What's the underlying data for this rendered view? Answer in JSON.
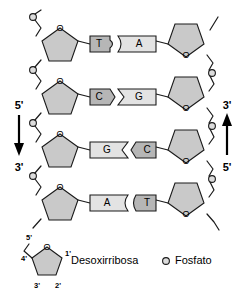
{
  "diagram": {
    "glyphs": {
      "oxygen": "O"
    },
    "strands": {
      "left": {
        "name": "left-strand",
        "top_label": "5'",
        "bottom_label": "3'",
        "direction": "down"
      },
      "right": {
        "name": "right-strand",
        "top_label": "3'",
        "bottom_label": "5'",
        "direction": "up"
      }
    },
    "base_pairs": [
      {
        "left_base": "T",
        "left_type": "pyrimidine",
        "right_base": "A",
        "right_type": "purine",
        "joint": "convex-right"
      },
      {
        "left_base": "C",
        "left_type": "pyrimidine",
        "right_base": "G",
        "right_type": "purine",
        "joint": "convex-right"
      },
      {
        "left_base": "G",
        "left_type": "purine",
        "right_base": "C",
        "right_type": "pyrimidine",
        "joint": "convex-left"
      },
      {
        "left_base": "A",
        "left_type": "purine",
        "right_base": "T",
        "right_type": "pyrimidine",
        "joint": "round-left"
      }
    ],
    "legend": {
      "sugar": {
        "label": "Desoxirribosa",
        "carbons": [
          "5'",
          "4'",
          "3'",
          "2'",
          "1'"
        ]
      },
      "phosphate": {
        "label": "Fosfato",
        "marker": "open-circle"
      }
    },
    "colors": {
      "purine_fill": "#e3e3e3",
      "pyrimidine_fill": "#b6b6b6",
      "sugar_fill": "#c9c9c9",
      "phosphate_fill": "#dcdcdc",
      "stroke": "#1a1a1a",
      "background": "#ffffff"
    }
  }
}
